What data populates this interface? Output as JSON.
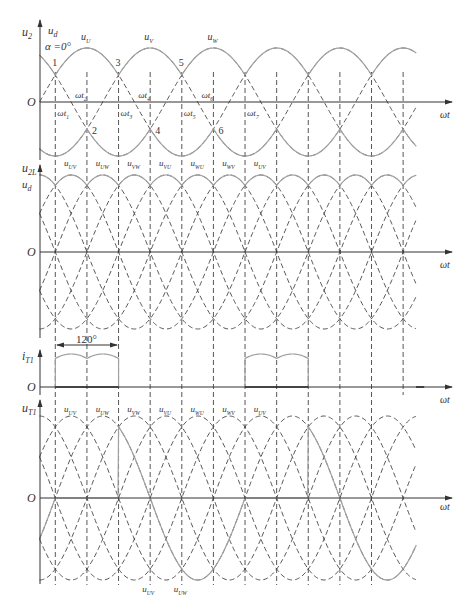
{
  "figure": {
    "type": "three-phase full-bridge controlled rectifier waveforms",
    "firing_angle": "α =0°",
    "axis_label": "ωt",
    "origin_label": "O",
    "colors": {
      "solid": "#a0a0a0",
      "dashed": "#444444",
      "axis": "#333333"
    }
  },
  "panels": {
    "phase_voltage": {
      "y_label": "u2",
      "y_label_sub": "2",
      "output_label": "u",
      "output_label_sub": "d",
      "alpha_label": "α =0°",
      "phase_labels": [
        {
          "base": "u",
          "sub": "U"
        },
        {
          "base": "u",
          "sub": "V"
        },
        {
          "base": "u",
          "sub": "W"
        }
      ],
      "point_labels": [
        "1",
        "2",
        "3",
        "4",
        "5",
        "6"
      ],
      "time_labels": [
        {
          "base": "ωt",
          "sub": "1"
        },
        {
          "base": "ωt",
          "sub": "2"
        },
        {
          "base": "ωt",
          "sub": "3"
        },
        {
          "base": "ωt",
          "sub": "4"
        },
        {
          "base": "ωt",
          "sub": "5"
        },
        {
          "base": "ωt",
          "sub": "6"
        },
        {
          "base": "ωt",
          "sub": "7"
        }
      ]
    },
    "line_voltage": {
      "y_label": "u",
      "y_label_sub": "2L",
      "output_label": "u",
      "output_label_sub": "d",
      "segment_labels": [
        {
          "base": "u",
          "sub": "UV"
        },
        {
          "base": "u",
          "sub": "UW"
        },
        {
          "base": "u",
          "sub": "VW"
        },
        {
          "base": "u",
          "sub": "VU"
        },
        {
          "base": "u",
          "sub": "WU"
        },
        {
          "base": "u",
          "sub": "WV"
        },
        {
          "base": "u",
          "sub": "UV"
        }
      ]
    },
    "thyristor_current": {
      "y_label": "i",
      "y_label_sub": "T1",
      "conduction_label": "120°"
    },
    "thyristor_voltage": {
      "y_label": "u",
      "y_label_sub": "T1",
      "segment_labels": [
        {
          "base": "u",
          "sub": "UV"
        },
        {
          "base": "u",
          "sub": "UW"
        },
        {
          "base": "u",
          "sub": "VW"
        },
        {
          "base": "u",
          "sub": "VU"
        },
        {
          "base": "u",
          "sub": "WU"
        },
        {
          "base": "u",
          "sub": "WV"
        },
        {
          "base": "u",
          "sub": "UV"
        }
      ],
      "bottom_labels": [
        {
          "base": "u",
          "sub": "UV"
        },
        {
          "base": "u",
          "sub": "UW"
        }
      ]
    }
  }
}
